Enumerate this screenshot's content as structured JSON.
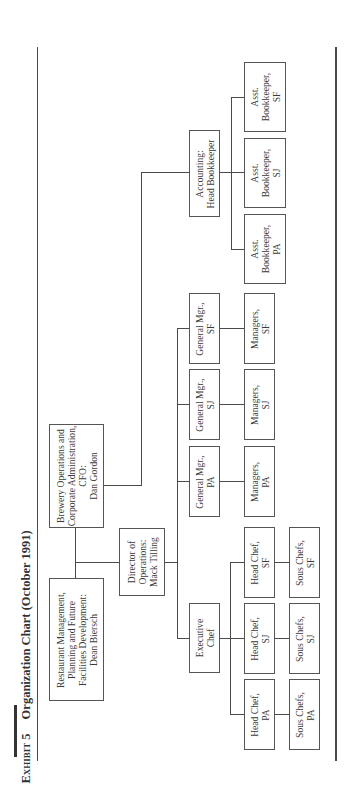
{
  "title": {
    "exhibit": "Exhibit 5",
    "text": "Organization Chart (October 1991)"
  },
  "nodes": {
    "restaurant": [
      "Restaurant Management,",
      "Planning and Future",
      "Facilities Development:",
      "Dean Biersch"
    ],
    "brewery": [
      "Brewery Operations and",
      "Corporate Administration,",
      "CFO:",
      "Dan Gordon"
    ],
    "director": [
      "Director of",
      "Operations:",
      "Mack Tilling"
    ],
    "accounting": [
      "Accounting:",
      "Head Bookkeeper"
    ],
    "asst_sf": [
      "Asst.",
      "Bookkeeper,",
      "SF"
    ],
    "asst_sj": [
      "Asst.",
      "Bookkeeper,",
      "SJ"
    ],
    "asst_pa": [
      "Asst.",
      "Bookkeeper,",
      "PA"
    ],
    "exec_chef": [
      "Executive",
      "Chef"
    ],
    "gm_pa": [
      "General Mgr.,",
      "PA"
    ],
    "gm_sj": [
      "General Mgr.,",
      "SJ"
    ],
    "gm_sf": [
      "General Mgr.,",
      "SF"
    ],
    "mgr_pa": [
      "Managers,",
      "PA"
    ],
    "mgr_sj": [
      "Managers,",
      "SJ"
    ],
    "mgr_sf": [
      "Managers,",
      "SF"
    ],
    "hc_pa": [
      "Head Chef,",
      "PA"
    ],
    "hc_sj": [
      "Head Chef,",
      "SJ"
    ],
    "hc_sf": [
      "Head Chef,",
      "SF"
    ],
    "sous_pa": [
      "Sous Chefs,",
      "PA"
    ],
    "sous_sj": [
      "Sous Chefs,",
      "SJ"
    ],
    "sous_sf": [
      "Sous Chefs,",
      "SF"
    ]
  }
}
